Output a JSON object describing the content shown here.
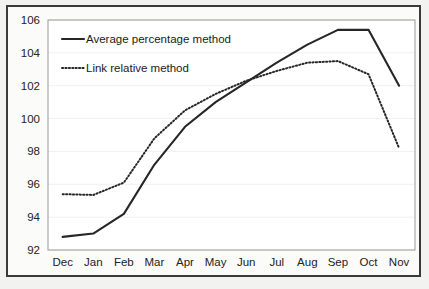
{
  "chart_data": {
    "type": "line",
    "title": "",
    "xlabel": "",
    "ylabel": "",
    "categories": [
      "Dec",
      "Jan",
      "Feb",
      "Mar",
      "Apr",
      "May",
      "Jun",
      "Jul",
      "Aug",
      "Sep",
      "Oct",
      "Nov"
    ],
    "ylim": [
      92,
      106
    ],
    "yticks": [
      92,
      94,
      96,
      98,
      100,
      102,
      104,
      106
    ],
    "ytick_labels": [
      "92",
      "94",
      "96",
      "98",
      "100",
      "102",
      "104",
      "106"
    ],
    "grid": false,
    "legend_position": "upper-left-inside",
    "series": [
      {
        "name": "Average percentage method",
        "style": "solid",
        "color": "#262626",
        "values": [
          92.8,
          93.0,
          94.2,
          97.2,
          99.5,
          101.0,
          102.2,
          103.4,
          104.5,
          105.4,
          105.4,
          102.0
        ]
      },
      {
        "name": "Link relative method",
        "style": "dotted",
        "color": "#262626",
        "values": [
          95.4,
          95.35,
          96.1,
          98.8,
          100.5,
          101.5,
          102.3,
          102.9,
          103.4,
          103.5,
          102.7,
          98.2
        ]
      }
    ]
  },
  "legend": {
    "entries": [
      {
        "label": "Average percentage method",
        "style": "solid"
      },
      {
        "label": "Link relative method",
        "style": "dotted"
      }
    ]
  },
  "colors": {
    "figure_background": "#f2f2f0",
    "plot_background": "#ffffff",
    "frame_border": "#3a3a3a",
    "axis_border": "#9a9a9a",
    "line": "#262626",
    "text": "#222222"
  }
}
